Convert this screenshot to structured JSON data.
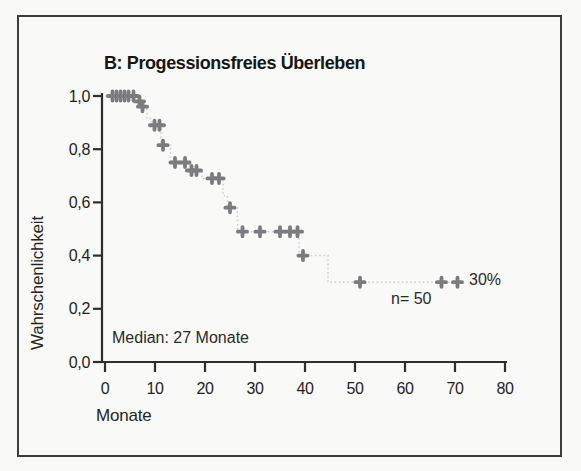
{
  "figure": {
    "panel_label": "B",
    "language": "de"
  },
  "chart_data": {
    "type": "line",
    "variant": "kaplan_meier_step",
    "title": "B: Progessionsfreies Überleben",
    "xlabel": "Monate",
    "ylabel": "Wahrschenlichkeit",
    "xlim": [
      0,
      80
    ],
    "ylim": [
      0.0,
      1.0
    ],
    "x_ticks": [
      0,
      10,
      20,
      30,
      40,
      50,
      60,
      70,
      80
    ],
    "x_tick_labels": [
      "0",
      "10",
      "20",
      "30",
      "40",
      "50",
      "60",
      "70",
      "80"
    ],
    "y_ticks": [
      0.0,
      0.2,
      0.4,
      0.6,
      0.8,
      1.0
    ],
    "y_tick_labels": [
      "0,0",
      "0,2",
      "0,4",
      "0,6",
      "0,8",
      "1,0"
    ],
    "grid": false,
    "legend": "none",
    "series": [
      {
        "name": "Progressionsfreies Überleben (Kaplan-Meier)",
        "n": 50,
        "median_months": 27,
        "plateau_probability": 0.3,
        "step_points": [
          [
            0,
            1.0
          ],
          [
            6.8,
            1.0
          ],
          [
            6.8,
            0.98
          ],
          [
            7.6,
            0.98
          ],
          [
            7.6,
            0.96
          ],
          [
            8.4,
            0.96
          ],
          [
            8.4,
            0.915
          ],
          [
            9.3,
            0.915
          ],
          [
            9.3,
            0.89
          ],
          [
            11.2,
            0.89
          ],
          [
            11.2,
            0.815
          ],
          [
            13.1,
            0.815
          ],
          [
            13.1,
            0.75
          ],
          [
            16.8,
            0.75
          ],
          [
            16.8,
            0.72
          ],
          [
            19.4,
            0.72
          ],
          [
            19.4,
            0.69
          ],
          [
            23.6,
            0.69
          ],
          [
            23.6,
            0.625
          ],
          [
            24.5,
            0.625
          ],
          [
            24.5,
            0.58
          ],
          [
            26.5,
            0.58
          ],
          [
            26.5,
            0.49
          ],
          [
            38.8,
            0.49
          ],
          [
            38.8,
            0.4
          ],
          [
            44.6,
            0.4
          ],
          [
            44.6,
            0.3
          ],
          [
            71.0,
            0.3
          ]
        ],
        "censor_marks": [
          [
            1.5,
            1.0
          ],
          [
            2.3,
            1.0
          ],
          [
            3.1,
            1.0
          ],
          [
            3.9,
            1.0
          ],
          [
            4.7,
            1.0
          ],
          [
            5.7,
            1.0
          ],
          [
            6.9,
            0.98
          ],
          [
            7.5,
            0.96
          ],
          [
            9.9,
            0.89
          ],
          [
            10.9,
            0.89
          ],
          [
            11.6,
            0.815
          ],
          [
            14.0,
            0.75
          ],
          [
            16.0,
            0.75
          ],
          [
            17.3,
            0.72
          ],
          [
            18.3,
            0.72
          ],
          [
            21.4,
            0.69
          ],
          [
            22.8,
            0.69
          ],
          [
            25.0,
            0.58
          ],
          [
            27.5,
            0.49
          ],
          [
            31.0,
            0.49
          ],
          [
            35.0,
            0.49
          ],
          [
            37.0,
            0.49
          ],
          [
            38.5,
            0.49
          ],
          [
            39.6,
            0.4
          ],
          [
            51.0,
            0.3
          ],
          [
            67.3,
            0.3
          ],
          [
            70.5,
            0.3
          ]
        ]
      }
    ],
    "annotations": [
      {
        "text": "Median: 27 Monate"
      },
      {
        "text": "n= 50"
      },
      {
        "text": "30%"
      }
    ],
    "colors": {
      "curve": "#cdcdca",
      "censor_marks": "#7b7b80",
      "axis": "#2e2e2e",
      "text": "#1f1f1f",
      "background": "#f9f9f7",
      "frame_border": "#3c3c3c"
    }
  }
}
